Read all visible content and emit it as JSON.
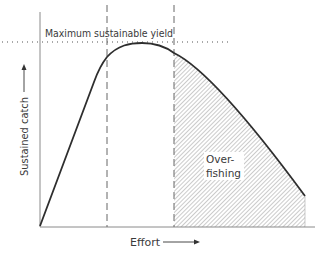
{
  "diagram": {
    "msy_label": "Maximum sustainable yield",
    "y_axis_label": "Sustained catch",
    "x_axis_label": "Effort",
    "region_label_line1": "Over-",
    "region_label_line2": "fishing",
    "colors": {
      "ink": "#2e2e2e",
      "axis": "#8a8a8a",
      "hatch": "#9a9a9a",
      "background": "#ffffff"
    },
    "elements": {
      "curve": "yield curve rising linearly, peaking at MSY, then declining",
      "dashed_lines": [
        "start of MSY plateau",
        "end of sustainable effort / start of overfishing"
      ],
      "dotted_line": "maximum sustainable yield level",
      "hatched_region": "overfishing region under curve to right of second dashed line"
    }
  }
}
